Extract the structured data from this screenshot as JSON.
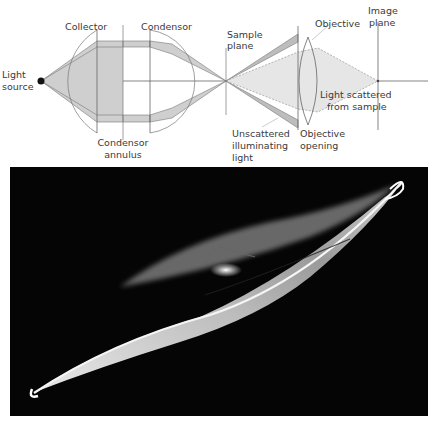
{
  "diagram": {
    "labels": {
      "light_source_1": "Light",
      "light_source_2": "source",
      "collector": "Collector",
      "condensor": "Condensor",
      "condensor_annulus_1": "Condensor",
      "condensor_annulus_2": "annulus",
      "sample_plane_1": "Sample",
      "sample_plane_2": "plane",
      "objective": "Objective",
      "image_plane_1": "Image",
      "image_plane_2": "plane",
      "scattered_1": "Light scattered",
      "scattered_2": "from sample",
      "unscattered_1": "Unscattered",
      "unscattered_2": "illuminating",
      "unscattered_3": "light",
      "objective_opening_1": "Objective",
      "objective_opening_2": "opening"
    },
    "colors": {
      "beam_fill": "#cfcfcf",
      "scatter_fill": "#e6e6e6",
      "line": "#555555"
    }
  },
  "photo": {
    "description": "Dark-field micrograph of an elongated diatom-like cell",
    "background": "#050505"
  }
}
